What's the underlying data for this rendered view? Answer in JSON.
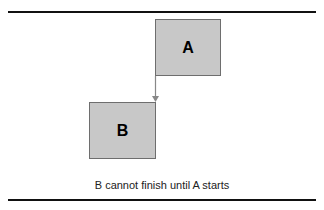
{
  "diagram": {
    "type": "dependency",
    "boxes": [
      {
        "id": "A",
        "label": "A",
        "color": "#c8c8c8"
      },
      {
        "id": "B",
        "label": "B",
        "color": "#c8c8c8"
      }
    ],
    "link": {
      "from": "A",
      "from_side": "start",
      "to": "B",
      "to_side": "finish",
      "color": "#888888"
    },
    "caption": "B cannot finish until A starts"
  }
}
